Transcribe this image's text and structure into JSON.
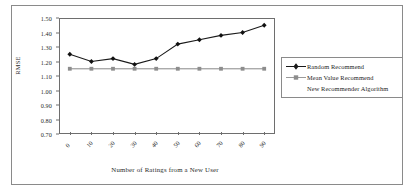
{
  "chart_data": {
    "type": "line",
    "title": "",
    "xlabel": "Number of Ratings from a New User",
    "ylabel": "RMSE",
    "xlim": [
      -5,
      95
    ],
    "ylim": [
      0.7,
      1.5
    ],
    "grid": false,
    "legend_position": "right",
    "x": [
      0,
      10,
      20,
      30,
      40,
      50,
      60,
      70,
      80,
      90
    ],
    "xticklabels": [
      "0",
      "10",
      "20",
      "30",
      "40",
      "50",
      "60",
      "70",
      "80",
      "90"
    ],
    "yticklabels": [
      "1.50",
      "1.40",
      "1.30",
      "1.20",
      "1.10",
      "1.00",
      "0.90",
      "0.80",
      "0.70"
    ],
    "yticks": [
      1.5,
      1.4,
      1.3,
      1.2,
      1.1,
      1.0,
      0.9,
      0.8,
      0.7
    ],
    "series": [
      {
        "name": "Random Recommend",
        "marker": "diamond",
        "color": "#1a1a1a",
        "values": [
          1.25,
          1.2,
          1.22,
          1.18,
          1.22,
          1.32,
          1.35,
          1.38,
          1.4,
          1.45
        ]
      },
      {
        "name": "Mean Value Recommend",
        "marker": "square",
        "color": "#9a9a9a",
        "values": [
          1.15,
          1.15,
          1.15,
          1.15,
          1.15,
          1.15,
          1.15,
          1.15,
          1.15,
          1.15
        ]
      },
      {
        "name": "New Recommender Algorithm",
        "marker": "none",
        "color": "#b5b5b5",
        "values": [
          1.15,
          1.15,
          1.15,
          1.15,
          1.15,
          1.15,
          1.15,
          1.15,
          1.15,
          1.15
        ]
      }
    ]
  },
  "legend": {
    "items": [
      {
        "label": "Random Recommend"
      },
      {
        "label": "Mean Value Recommend"
      },
      {
        "label": "New Recommender Algorithm"
      }
    ]
  }
}
